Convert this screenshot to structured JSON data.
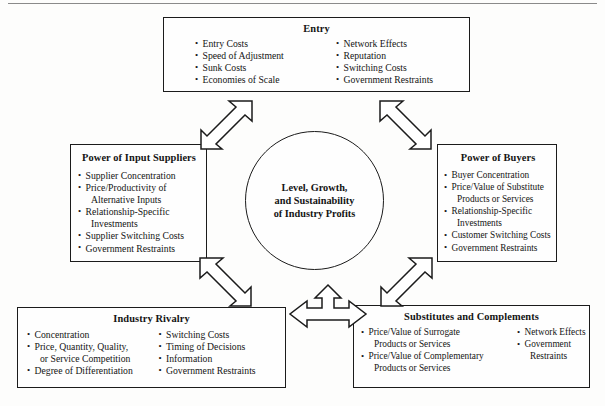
{
  "diagram": {
    "center": {
      "label": "Level, Growth, and Sustainability of Industry Profits",
      "line1": "Level, Growth,",
      "line2": "and Sustainability",
      "line3": "of Industry Profits"
    },
    "boxes": {
      "entry": {
        "title": "Entry",
        "column_left": [
          "Entry Costs",
          "Speed of Adjustment",
          "Sunk Costs",
          "Economies of Scale"
        ],
        "column_right": [
          "Network Effects",
          "Reputation",
          "Switching Costs",
          "Government Restraints"
        ]
      },
      "suppliers": {
        "title": "Power of Input Suppliers",
        "items": [
          {
            "text": "Supplier Concentration",
            "continuation": null
          },
          {
            "text": "Price/Productivity of",
            "continuation": "Alternative Inputs"
          },
          {
            "text": "Relationship-Specific",
            "continuation": "Investments"
          },
          {
            "text": "Supplier Switching Costs",
            "continuation": null
          },
          {
            "text": "Government Restraints",
            "continuation": null
          }
        ]
      },
      "buyers": {
        "title": "Power of Buyers",
        "items": [
          {
            "text": "Buyer Concentration",
            "continuation": null
          },
          {
            "text": "Price/Value of Substitute",
            "continuation": "Products or Services"
          },
          {
            "text": "Relationship-Specific",
            "continuation": "Investments"
          },
          {
            "text": "Customer Switching Costs",
            "continuation": null
          },
          {
            "text": "Government Restraints",
            "continuation": null
          }
        ]
      },
      "rivalry": {
        "title": "Industry Rivalry",
        "column_left": [
          {
            "text": "Concentration",
            "continuation": null
          },
          {
            "text": "Price, Quantity, Quality,",
            "continuation": "or Service Competition"
          },
          {
            "text": "Degree of Differentiation",
            "continuation": null
          }
        ],
        "column_right": [
          {
            "text": "Switching Costs",
            "continuation": null
          },
          {
            "text": "Timing of Decisions",
            "continuation": null
          },
          {
            "text": "Information",
            "continuation": null
          },
          {
            "text": "Government Restraints",
            "continuation": null
          }
        ]
      },
      "substitutes": {
        "title": "Substitutes and Complements",
        "column_left": [
          {
            "text": "Price/Value of Surrogate",
            "continuation": "Products or Services"
          },
          {
            "text": "Price/Value of Complementary",
            "continuation": "Products or Services"
          }
        ],
        "column_right": [
          {
            "text": "Network Effects",
            "continuation": null
          },
          {
            "text": "Government",
            "continuation": "Restraints"
          }
        ]
      }
    },
    "arrows": [
      {
        "name": "arrow-entry-suppliers",
        "direction": "double-diagonal-ne-sw"
      },
      {
        "name": "arrow-entry-buyers",
        "direction": "double-diagonal-nw-se"
      },
      {
        "name": "arrow-rivalry-suppliers",
        "direction": "double-diagonal-nw-se"
      },
      {
        "name": "arrow-rivalry-buyers",
        "direction": "double-diagonal-ne-sw"
      },
      {
        "name": "arrow-center-bottom-three-way",
        "direction": "up-left-right"
      }
    ]
  },
  "colors": {
    "page_background": "#fdfdfc",
    "box_border": "#1b1b1b",
    "text": "#141414",
    "rule": "#8a8a8a"
  }
}
